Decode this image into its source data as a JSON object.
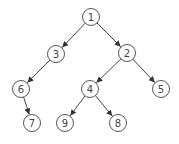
{
  "diagram": {
    "type": "binary-tree",
    "node_radius": 8.5,
    "colors": {
      "stroke": "#555555",
      "edge": "#444444",
      "text": "#444444",
      "background": "#ffffff"
    },
    "nodes": [
      {
        "id": "n1",
        "label": "1",
        "x": 91,
        "y": 17
      },
      {
        "id": "n3",
        "label": "3",
        "x": 56,
        "y": 54
      },
      {
        "id": "n2",
        "label": "2",
        "x": 127,
        "y": 53
      },
      {
        "id": "n6",
        "label": "6",
        "x": 21,
        "y": 89
      },
      {
        "id": "n4",
        "label": "4",
        "x": 90,
        "y": 89
      },
      {
        "id": "n5",
        "label": "5",
        "x": 161,
        "y": 89
      },
      {
        "id": "n7",
        "label": "7",
        "x": 32,
        "y": 123
      },
      {
        "id": "n9",
        "label": "9",
        "x": 65,
        "y": 123
      },
      {
        "id": "n8",
        "label": "8",
        "x": 118,
        "y": 123
      }
    ],
    "edges": [
      {
        "from": "n1",
        "to": "n3"
      },
      {
        "from": "n1",
        "to": "n2"
      },
      {
        "from": "n3",
        "to": "n6"
      },
      {
        "from": "n2",
        "to": "n4"
      },
      {
        "from": "n2",
        "to": "n5"
      },
      {
        "from": "n6",
        "to": "n7"
      },
      {
        "from": "n4",
        "to": "n9"
      },
      {
        "from": "n4",
        "to": "n8"
      }
    ]
  }
}
